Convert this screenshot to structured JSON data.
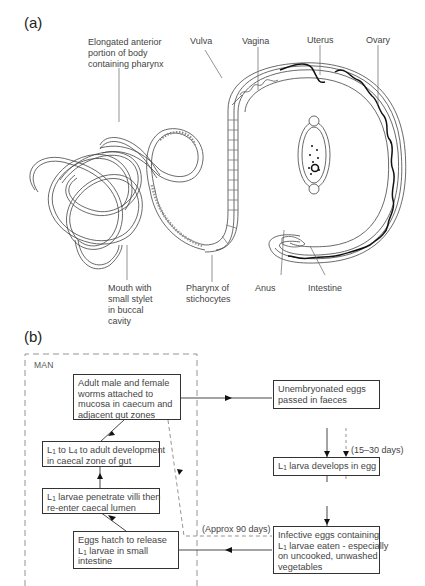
{
  "figure": {
    "panel_a": {
      "label": "(a)",
      "anatomy_labels": {
        "anterior": [
          "Elongated anterior",
          "portion of body",
          "containing pharynx"
        ],
        "vulva": "Vulva",
        "vagina": "Vagina",
        "uterus": "Uterus",
        "ovary": "Ovary",
        "mouth": [
          "Mouth with",
          "small stylet",
          "in buccal",
          "cavity"
        ],
        "pharynx": [
          "Pharynx of",
          "stichocytes"
        ],
        "anus": "Anus",
        "intestine": "Intestine"
      },
      "inset": "egg-illustration"
    },
    "panel_b": {
      "label": "(b)",
      "host_region_label": "MAN",
      "boxes": {
        "adult": [
          "Adult male and female",
          "worms attached to",
          "mucosa in caecum and",
          "adjacent gut zones"
        ],
        "l1_l4_pre": "L",
        "l1_l4": [
          "to L",
          "to adult development",
          "in caecal zone of gut"
        ],
        "penetrate": [
          "larvae penetrate villi then",
          "re-enter caecal lumen"
        ],
        "hatch": [
          "Eggs hatch to release",
          "larvae in small",
          "intestine"
        ],
        "unembryonated": [
          "Unembryonated eggs",
          "passed in faeces"
        ],
        "l1_develops": "larva develops in egg",
        "infective": [
          "Infective eggs containing",
          "larvae eaten - especially",
          "on uncooked, unwashed",
          "vegetables"
        ]
      },
      "subscripts": {
        "one": "1",
        "four": "4"
      },
      "annotations": {
        "days_15_30": "(15–30 days)",
        "days_90": "(Approx 90 days)"
      }
    }
  }
}
